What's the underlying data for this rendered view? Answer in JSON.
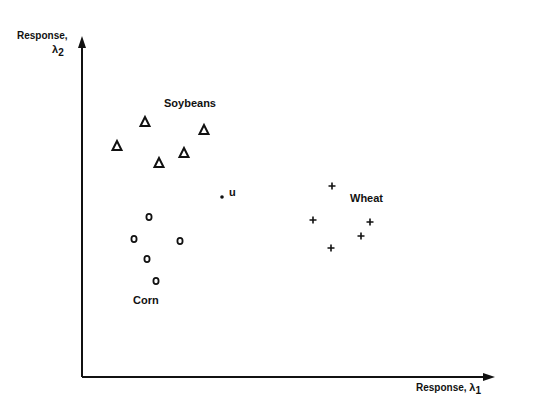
{
  "chart_data": {
    "type": "scatter",
    "title": "",
    "xlabel": "Response, λ1",
    "ylabel": "Response, λ2",
    "xlabel_main": "Response,",
    "xlabel_symbol": "λ",
    "xlabel_sub": "1",
    "ylabel_main": "Response,",
    "ylabel_symbol": "λ",
    "ylabel_sub": "2",
    "grid": false,
    "ticks": "none",
    "series": [
      {
        "name": "Soybeans",
        "marker": "triangle",
        "points": [
          [
            117,
            146
          ],
          [
            145,
            122
          ],
          [
            159,
            163
          ],
          [
            184,
            153
          ],
          [
            204,
            130
          ]
        ]
      },
      {
        "name": "Corn",
        "marker": "circle",
        "points": [
          [
            149,
            217
          ],
          [
            134,
            239
          ],
          [
            180,
            241
          ],
          [
            147,
            259
          ],
          [
            156,
            281
          ]
        ]
      },
      {
        "name": "Wheat",
        "marker": "plus",
        "points": [
          [
            332,
            186
          ],
          [
            313,
            220
          ],
          [
            370,
            222
          ],
          [
            361,
            236
          ],
          [
            331,
            248
          ]
        ]
      },
      {
        "name": "u",
        "marker": "dot",
        "points": [
          [
            222,
            197
          ]
        ]
      }
    ],
    "annotations": [
      {
        "text": "Soybeans",
        "x": 164,
        "y": 97
      },
      {
        "text": "Corn",
        "x": 133,
        "y": 294
      },
      {
        "text": "Wheat",
        "x": 350,
        "y": 192
      },
      {
        "text": "u",
        "x": 229,
        "y": 187
      }
    ]
  }
}
